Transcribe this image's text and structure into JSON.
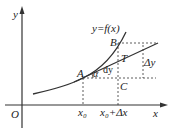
{
  "diagram": {
    "labels": {
      "y_axis": "y",
      "x_axis": "x",
      "origin": "O",
      "curve": "y=f(x)",
      "point_a": "A",
      "point_b": "B",
      "point_t": "T",
      "point_c": "C",
      "angle": "α",
      "dy": "dy",
      "delta_y": "Δy",
      "x0": "x₀",
      "x0_plus_dx": "x₀+Δx"
    },
    "colors": {
      "stroke": "#333333",
      "background": "#ffffff"
    }
  }
}
